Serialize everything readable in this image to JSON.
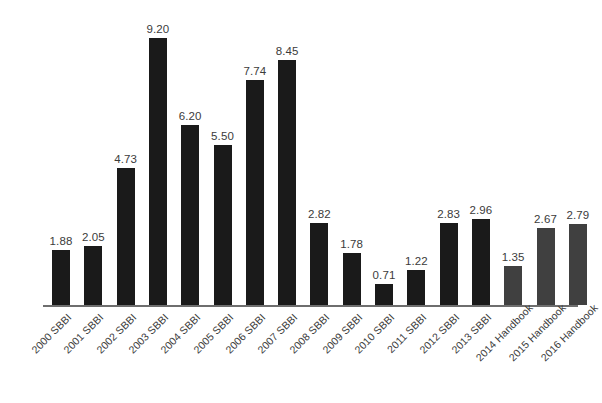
{
  "chart_data": {
    "type": "bar",
    "title": "",
    "subtitle": "",
    "xlabel": "",
    "ylabel": "",
    "ylim": [
      0,
      9.2
    ],
    "grid": false,
    "legend": "none",
    "value_label_format": "2 decimal places, shown above each bar",
    "x_tick_rotation": -45,
    "categories": [
      "2000 SBBI",
      "2001 SBBI",
      "2002 SBBI",
      "2003 SBBI",
      "2004 SBBI",
      "2005 SBBI",
      "2006 SBBI",
      "2007 SBBI",
      "2008 SBBI",
      "2009 SBBI",
      "2010 SBBI",
      "2011 SBBI",
      "2012 SBBI",
      "2013 SBBI",
      "2014 Handbook",
      "2015 Handbook",
      "2016 Handbook"
    ],
    "values": [
      1.88,
      2.05,
      4.73,
      9.2,
      6.2,
      5.5,
      7.74,
      8.45,
      2.82,
      1.78,
      0.71,
      1.22,
      2.83,
      2.96,
      1.35,
      2.67,
      2.79
    ],
    "value_labels": [
      "1.88",
      "2.05",
      "4.73",
      "9.20",
      "6.20",
      "5.50",
      "7.74",
      "8.45",
      "2.82",
      "1.78",
      "0.71",
      "1.22",
      "2.83",
      "2.96",
      "1.35",
      "2.67",
      "2.79"
    ],
    "bar_colors": [
      "#1a1a1a",
      "#1a1a1a",
      "#1a1a1a",
      "#1a1a1a",
      "#1a1a1a",
      "#1a1a1a",
      "#1a1a1a",
      "#1a1a1a",
      "#1a1a1a",
      "#1a1a1a",
      "#1a1a1a",
      "#1a1a1a",
      "#1a1a1a",
      "#1a1a1a",
      "#404040",
      "#404040",
      "#404040"
    ],
    "colors": {
      "sbbi_bar": "#1a1a1a",
      "handbook_bar": "#404040",
      "axis_line": "#6e6e6e",
      "label_text": "#3b3b3b",
      "background": "#ffffff"
    }
  }
}
